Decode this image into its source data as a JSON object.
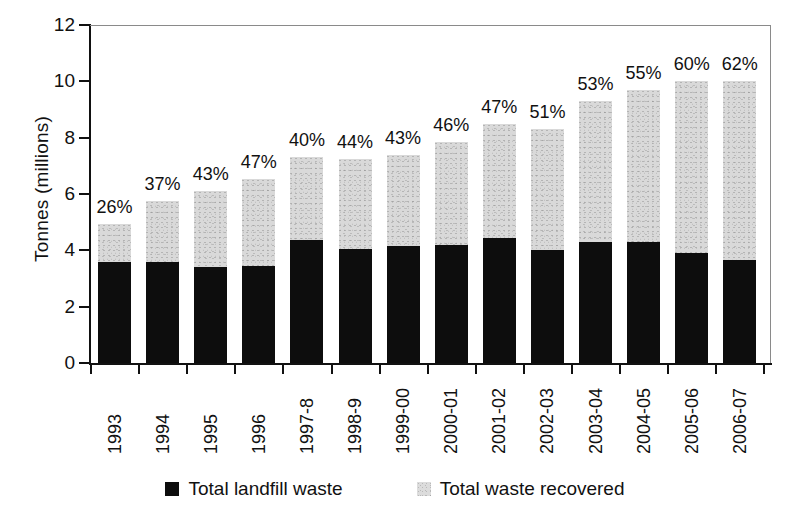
{
  "chart_data": {
    "type": "bar",
    "subtype": "stacked",
    "title": "",
    "xlabel": "",
    "ylabel": "Tonnes (millions)",
    "ylim": [
      0,
      12
    ],
    "yticks": [
      0,
      2,
      4,
      6,
      8,
      10,
      12
    ],
    "ytick_labels": [
      "0",
      "2",
      "4",
      "6",
      "8",
      "10",
      "12"
    ],
    "grid": false,
    "legend_position": "bottom",
    "categories": [
      "1993",
      "1994",
      "1995",
      "1996",
      "1997-8",
      "1998-9",
      "1999-00",
      "2000-01",
      "2001-02",
      "2002-03",
      "2003-04",
      "2004-05",
      "2005-06",
      "2006-07"
    ],
    "series": [
      {
        "name": "Total landfill waste",
        "color": "#0d0d0d",
        "values": [
          3.6,
          3.6,
          3.4,
          3.45,
          4.35,
          4.05,
          4.15,
          4.2,
          4.45,
          4.0,
          4.3,
          4.3,
          3.9,
          3.65
        ]
      },
      {
        "name": "Total waste recovered",
        "color": "#d9d9d9",
        "values": [
          1.35,
          2.15,
          2.7,
          3.1,
          2.95,
          3.2,
          3.25,
          3.65,
          4.05,
          4.3,
          5.0,
          5.4,
          6.1,
          6.35
        ]
      }
    ],
    "totals": [
      4.95,
      5.75,
      6.1,
      6.55,
      7.3,
      7.25,
      7.4,
      7.85,
      8.5,
      8.3,
      9.3,
      9.7,
      10.0,
      10.0
    ],
    "annotations": {
      "label": "percent recovered shown above each bar",
      "values": [
        "26%",
        "37%",
        "43%",
        "47%",
        "40%",
        "44%",
        "43%",
        "46%",
        "47%",
        "51%",
        "53%",
        "55%",
        "60%",
        "62%"
      ]
    }
  },
  "legend": {
    "items": [
      {
        "label": "Total landfill waste",
        "swatch": "black"
      },
      {
        "label": "Total waste recovered",
        "swatch": "grey"
      }
    ]
  },
  "colors": {
    "landfill": "#0d0d0d",
    "recovered": "#d9d9d9",
    "axis": "#111111",
    "plot_border": "#8a8a8a",
    "background": "#ffffff"
  }
}
